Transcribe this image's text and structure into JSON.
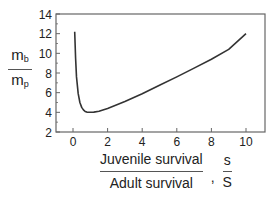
{
  "chart_data": {
    "type": "line",
    "title": "",
    "ylabel": {
      "numerator": "m",
      "numerator_sub": "b",
      "denominator": "m",
      "denominator_sub": "p"
    },
    "xlabel": {
      "numerator": "Juvenile survival",
      "denominator": "Adult survival",
      "separator": ",",
      "symbol_numerator": "s",
      "symbol_denominator": "S"
    },
    "xlim": [
      -0.8,
      11.2
    ],
    "ylim": [
      2,
      14
    ],
    "xticks": [
      0,
      2,
      4,
      6,
      8,
      10
    ],
    "yticks": [
      2,
      4,
      6,
      8,
      10,
      12,
      14
    ],
    "grid": false,
    "legend": null,
    "series": [
      {
        "name": "mb/mp",
        "x": [
          0.1,
          0.15,
          0.2,
          0.3,
          0.4,
          0.5,
          0.6,
          0.7,
          0.8,
          1.0,
          1.2,
          1.5,
          2.0,
          3.0,
          4.0,
          5.0,
          6.0,
          7.0,
          8.0,
          9.0,
          10.0
        ],
        "values": [
          12.2,
          9.5,
          7.6,
          5.9,
          5.0,
          4.5,
          4.25,
          4.1,
          4.02,
          4.0,
          4.02,
          4.12,
          4.4,
          5.1,
          5.9,
          6.75,
          7.6,
          8.5,
          9.4,
          10.4,
          12.0
        ]
      }
    ]
  },
  "y_axis_label": {
    "num_main": "m",
    "num_sub": "b",
    "den_main": "m",
    "den_sub": "p"
  },
  "x_axis_label": {
    "num": "Juvenile survival",
    "den": "Adult survival",
    "sep": ",",
    "sym_num": "s",
    "sym_den": "S"
  },
  "colors": {
    "line": "#333333",
    "axis": "#666666",
    "text": "#222222"
  }
}
